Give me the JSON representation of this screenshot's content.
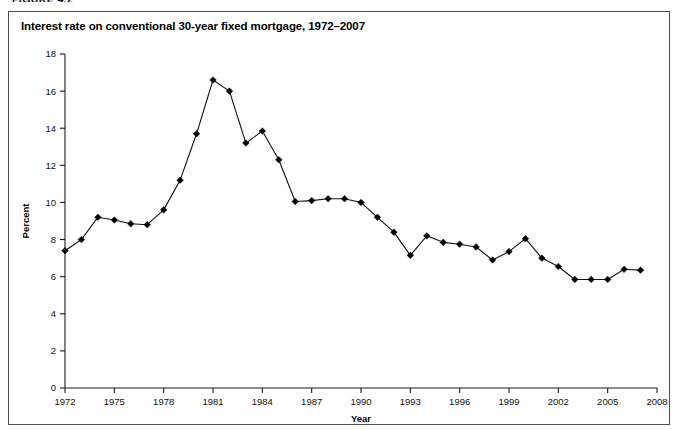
{
  "figure": {
    "label": "FIGURE 4.2",
    "title": "Interest rate on conventional 30-year fixed mortgage, 1972–2007"
  },
  "chart_data": {
    "type": "line",
    "title": "Interest rate on conventional 30-year fixed mortgage, 1972–2007",
    "xlabel": "Year",
    "ylabel": "Percent",
    "xlim": [
      1972,
      2008
    ],
    "ylim": [
      0,
      18
    ],
    "xticks": [
      1972,
      1975,
      1978,
      1981,
      1984,
      1987,
      1990,
      1993,
      1996,
      1999,
      2002,
      2005,
      2008
    ],
    "xtick_labels": [
      "1972",
      "1975",
      "1978",
      "1981",
      "1984",
      "1987",
      "1990",
      "1993",
      "1996",
      "1999",
      "2002",
      "2005",
      "2008"
    ],
    "yticks": [
      0,
      2,
      4,
      6,
      8,
      10,
      12,
      14,
      16,
      18
    ],
    "ytick_labels": [
      "0",
      "2",
      "4",
      "6",
      "8",
      "10",
      "12",
      "14",
      "16",
      "18"
    ],
    "grid": false,
    "legend": false,
    "marker": "diamond",
    "line_color": "#111111",
    "marker_color": "#000000",
    "x": [
      1972,
      1973,
      1974,
      1975,
      1976,
      1977,
      1978,
      1979,
      1980,
      1981,
      1982,
      1983,
      1984,
      1985,
      1986,
      1987,
      1988,
      1989,
      1990,
      1991,
      1992,
      1993,
      1994,
      1995,
      1996,
      1997,
      1998,
      1999,
      2000,
      2001,
      2002,
      2003,
      2004,
      2005,
      2006,
      2007
    ],
    "values": [
      7.4,
      8.0,
      9.2,
      9.05,
      8.85,
      8.8,
      9.6,
      11.2,
      13.7,
      16.6,
      16.0,
      13.2,
      13.85,
      12.3,
      10.05,
      10.1,
      10.2,
      10.2,
      10.0,
      9.2,
      8.4,
      7.15,
      8.2,
      7.85,
      7.75,
      7.6,
      6.9,
      7.35,
      8.05,
      7.0,
      6.55,
      5.85,
      5.85,
      5.85,
      6.4,
      6.35
    ],
    "series": [
      {
        "name": "Interest rate on conventional 30-year fixed mortgage",
        "values": [
          7.4,
          8.0,
          9.2,
          9.05,
          8.85,
          8.8,
          9.6,
          11.2,
          13.7,
          16.6,
          16.0,
          13.2,
          13.85,
          12.3,
          10.05,
          10.1,
          10.2,
          10.2,
          10.0,
          9.2,
          8.4,
          7.15,
          8.2,
          7.85,
          7.75,
          7.6,
          6.9,
          7.35,
          8.05,
          7.0,
          6.55,
          5.85,
          5.85,
          5.85,
          6.4,
          6.35
        ]
      }
    ]
  }
}
